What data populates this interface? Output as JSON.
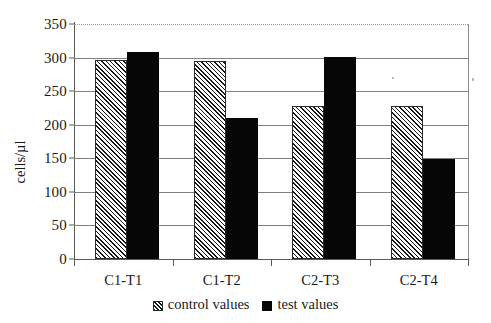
{
  "chart_data": {
    "type": "bar",
    "title": "",
    "xlabel": "",
    "ylabel": "cells/µl",
    "ylim": [
      0,
      350
    ],
    "ytick_step": 50,
    "yticks": [
      350,
      300,
      250,
      200,
      150,
      100,
      50,
      0
    ],
    "ytick_labels": [
      "350",
      "300",
      "250",
      "200",
      "150",
      "100",
      "50",
      "0"
    ],
    "categories": [
      "C1-T1",
      "C1-T2",
      "C2-T3",
      "C2-T4"
    ],
    "grid": true,
    "legend_position": "bottom-center",
    "series": [
      {
        "name": "control values",
        "style": "hatched",
        "color": "#ffffff",
        "hatch_color": "#161616",
        "values": [
          296,
          295,
          228,
          228
        ]
      },
      {
        "name": "test values",
        "style": "solid",
        "color": "#060606",
        "values": [
          308,
          210,
          301,
          149
        ]
      }
    ]
  },
  "axes": {
    "y_title": "cells/µl"
  },
  "legend": {
    "items": [
      {
        "label": "control values",
        "swatch": "hatched-square-icon"
      },
      {
        "label": "test values",
        "swatch": "filled-square-icon"
      }
    ]
  }
}
